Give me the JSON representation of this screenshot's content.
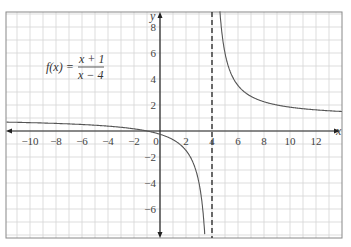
{
  "chart_data": {
    "type": "line",
    "function": {
      "lhs": "f(x) =",
      "numerator": "x + 1",
      "denominator": "x − 4"
    },
    "xlabel": "x",
    "ylabel": "y",
    "xlim": [
      -11.8,
      14
    ],
    "ylim": [
      -8.2,
      9.2
    ],
    "x_ticks": [
      "−10",
      "−8",
      "−6",
      "−4",
      "−2",
      "0",
      "2",
      "4",
      "6",
      "8",
      "10",
      "12"
    ],
    "y_ticks": [
      "8",
      "6",
      "4",
      "2",
      "−2",
      "−4",
      "−6"
    ],
    "grid": true,
    "asymptotes": {
      "vertical": 4,
      "horizontal": 1
    },
    "series": [
      {
        "name": "left branch",
        "x": [
          -11.8,
          -10,
          -8,
          -6,
          -4,
          -2,
          -1,
          0,
          1,
          2,
          3,
          3.5,
          3.75
        ],
        "y": [
          0.69,
          0.64,
          0.58,
          0.5,
          0.38,
          0.17,
          0,
          -0.25,
          -0.67,
          -1.5,
          -4,
          -9,
          -19
        ]
      },
      {
        "name": "right branch",
        "x": [
          4.25,
          4.5,
          5,
          6,
          7,
          8,
          10,
          12,
          14
        ],
        "y": [
          21,
          11,
          6,
          3.5,
          2.67,
          2.25,
          1.83,
          1.63,
          1.5
        ]
      }
    ]
  }
}
